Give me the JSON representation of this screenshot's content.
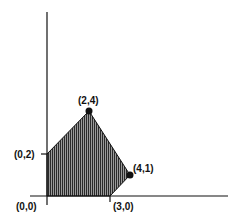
{
  "diagram": {
    "type": "feasible-region",
    "axes": {
      "x_axis": "horizontal",
      "y_axis": "vertical"
    },
    "region_vertices": [
      {
        "x": 0,
        "y": 0
      },
      {
        "x": 0,
        "y": 2
      },
      {
        "x": 2,
        "y": 4
      },
      {
        "x": 4,
        "y": 1
      },
      {
        "x": 3,
        "y": 0
      }
    ],
    "labels": {
      "origin": "(0,0)",
      "p02": "(0,2)",
      "p24": "(2,4)",
      "p41": "(4,1)",
      "p30": "(3,0)"
    },
    "marked_points": [
      "(2,4)",
      "(4,1)"
    ],
    "fill_style": "vertical-hatch",
    "colors": {
      "line": "#111111",
      "hatch": "#333333",
      "background": "#ffffff"
    }
  }
}
